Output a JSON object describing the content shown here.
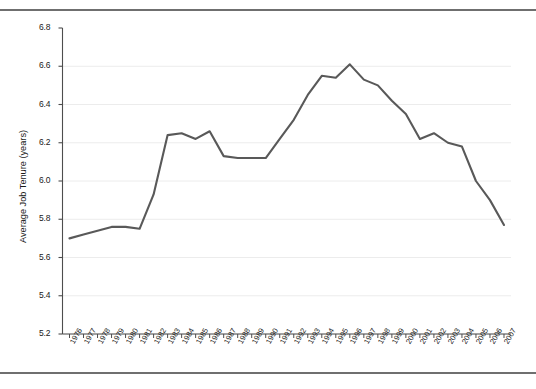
{
  "chart_data": {
    "type": "line",
    "title": "",
    "xlabel": "",
    "ylabel": "Average Job Tenure (years)",
    "ylim": [
      5.2,
      6.8
    ],
    "ytick_step": 0.2,
    "yticks": [
      "5.2",
      "5.4",
      "5.6",
      "5.8",
      "6.0",
      "6.2",
      "6.4",
      "6.6",
      "6.8"
    ],
    "grid": "horizontal",
    "legend": "none",
    "line_color": "#595959",
    "categories": [
      "1976",
      "1977",
      "1978",
      "1979",
      "1980",
      "1981",
      "1982",
      "1983",
      "1984",
      "1985",
      "1986",
      "1987",
      "1988",
      "1989",
      "1990",
      "1991",
      "1992",
      "1993",
      "1994",
      "1995",
      "1996",
      "1997",
      "1998",
      "1999",
      "2000",
      "2001",
      "2002",
      "2003",
      "2004",
      "2005",
      "2006",
      "2007"
    ],
    "values": [
      5.7,
      5.72,
      5.74,
      5.76,
      5.76,
      5.75,
      5.93,
      6.24,
      6.25,
      6.22,
      6.26,
      6.13,
      6.12,
      6.12,
      6.12,
      6.22,
      6.32,
      6.45,
      6.55,
      6.54,
      6.61,
      6.53,
      6.5,
      6.42,
      6.35,
      6.22,
      6.25,
      6.2,
      6.18,
      6.0,
      5.9,
      5.77
    ]
  },
  "frame": {
    "top_rule": "horizontal-rule",
    "bottom_rule": "horizontal-rule"
  }
}
